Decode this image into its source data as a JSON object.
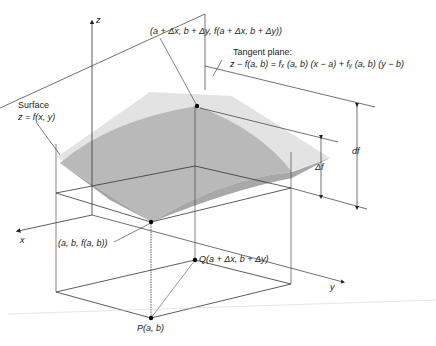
{
  "diagram": {
    "axes": {
      "z_label": "z",
      "x_label": "x",
      "y_label": "y"
    },
    "labels": {
      "top_point": "(a + Δx, b + Δy, f(a + Δx, b + Δy))",
      "tangent_title": "Tangent plane:",
      "tangent_equation": "z − f(a, b) = fₓ (a, b) (x − a) + fᵧ (a, b) (y − b)",
      "surface_title": "Surface",
      "surface_equation": "z = f(x, y)",
      "base_point": "(a, b, f(a, b))",
      "point_q": "Q(a + Δx, b + Δy)",
      "point_p": "P(a, b)",
      "delta_f": "Δf",
      "df": "df"
    },
    "colors": {
      "tangent_plane": "#e2e2e2",
      "surface": "#b8b8b8",
      "surface_dark": "#a6a6a6",
      "line": "#333333"
    }
  }
}
